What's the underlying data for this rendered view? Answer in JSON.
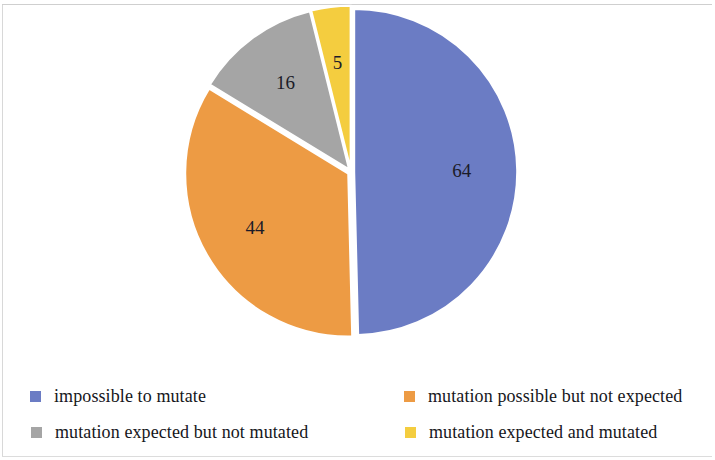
{
  "chart_data": {
    "type": "pie",
    "title": "",
    "subtitle": "",
    "xlabel": "",
    "ylabel": "",
    "grid": false,
    "legend_position": "bottom",
    "total": 129,
    "categories": [
      "impossible to mutate",
      "mutation possible but not expected",
      "mutation expected but not mutated",
      "mutation expected and mutated"
    ],
    "values": [
      64,
      44,
      16,
      5
    ],
    "data_labels": [
      "64",
      "44",
      "16",
      "5"
    ],
    "colors": [
      "#6b7cc4",
      "#ed9b44",
      "#a5a5a5",
      "#f4cd3f"
    ],
    "slices": [
      {
        "label": "impossible to mutate",
        "value": 64,
        "data_label": "64",
        "color": "#6b7cc4",
        "percent": 49.6
      },
      {
        "label": "mutation possible but not expected",
        "value": 44,
        "data_label": "44",
        "color": "#ed9b44",
        "percent": 34.1
      },
      {
        "label": "mutation expected but not mutated",
        "value": 16,
        "data_label": "16",
        "color": "#a5a5a5",
        "percent": 12.4
      },
      {
        "label": "mutation expected and mutated",
        "value": 5,
        "data_label": "5",
        "color": "#f4cd3f",
        "percent": 3.9
      }
    ]
  },
  "legend": {
    "items": [
      {
        "label": "impossible to mutate",
        "color": "#6b7cc4"
      },
      {
        "label": "mutation possible but not expected",
        "color": "#ed9b44"
      },
      {
        "label": "mutation expected but not mutated",
        "color": "#a5a5a5"
      },
      {
        "label": "mutation expected and mutated",
        "color": "#f4cd3f"
      }
    ]
  }
}
